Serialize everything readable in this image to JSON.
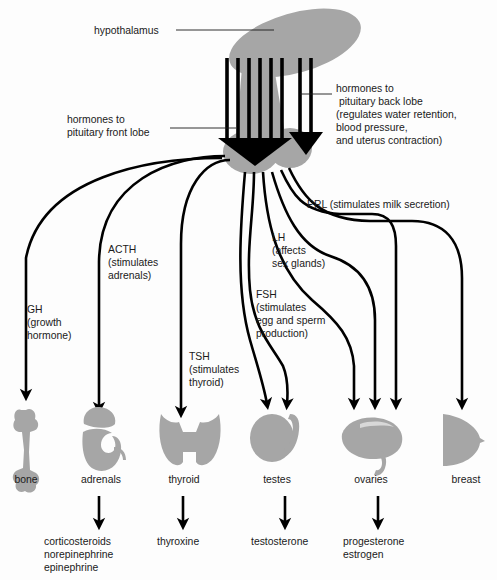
{
  "figure": {
    "colors": {
      "organ_gray": "#a6a6a6",
      "line_black": "#000000",
      "background": "#fdfdfd",
      "text": "#1a1a1a"
    }
  },
  "callouts": {
    "hypothalamus": "hypothalamus",
    "front_lobe_line1": "hormones to",
    "front_lobe_line2": "pituitary front lobe",
    "back_lobe_line1": "hormones to",
    "back_lobe_line2": "pituitary back lobe",
    "back_lobe_line3": "(regulates water retention,",
    "back_lobe_line4": "blood pressure,",
    "back_lobe_line5": "and uterus contraction)"
  },
  "hormones": [
    {
      "id": "gh",
      "abbr": "GH",
      "lines": [
        "GH",
        "(growth",
        "hormone)"
      ],
      "target": "bone"
    },
    {
      "id": "acth",
      "abbr": "ACTH",
      "lines": [
        "ACTH",
        "(stimulates",
        "adrenals)"
      ],
      "target": "adrenals"
    },
    {
      "id": "tsh",
      "abbr": "TSH",
      "lines": [
        "TSH",
        "(stimulates",
        "thyroid)"
      ],
      "target": "thyroid"
    },
    {
      "id": "fsh",
      "abbr": "FSH",
      "lines": [
        "FSH",
        "(stimulates",
        "egg and sperm",
        "production)"
      ],
      "target": "testes, ovaries"
    },
    {
      "id": "lh",
      "abbr": "LH",
      "lines": [
        "LH",
        "(affects",
        "sex glands)"
      ],
      "target": "testes, ovaries"
    },
    {
      "id": "prl",
      "abbr": "PRL",
      "lines": [
        "PRL (stimulates milk secretion)"
      ],
      "target": "ovaries, breast"
    }
  ],
  "organs": [
    {
      "id": "bone",
      "label": "bone",
      "shape": "femur"
    },
    {
      "id": "adrenals",
      "label": "adrenals",
      "shape": "kidney-with-cap"
    },
    {
      "id": "thyroid",
      "label": "thyroid",
      "shape": "butterfly"
    },
    {
      "id": "testes",
      "label": "testes",
      "shape": "oval-with-duct"
    },
    {
      "id": "ovaries",
      "label": "ovaries",
      "shape": "bean-with-tube"
    },
    {
      "id": "breast",
      "label": "breast",
      "shape": "rounded-triangle"
    }
  ],
  "products": [
    {
      "id": "adrenal-products",
      "from": "adrenals",
      "lines": [
        "corticosteroids",
        "norepinephrine",
        "epinephrine"
      ]
    },
    {
      "id": "thyroid-products",
      "from": "thyroid",
      "lines": [
        "thyroxine"
      ]
    },
    {
      "id": "testes-products",
      "from": "testes",
      "lines": [
        "testosterone"
      ]
    },
    {
      "id": "ovaries-products",
      "from": "ovaries",
      "lines": [
        "progesterone",
        "estrogen"
      ]
    }
  ]
}
